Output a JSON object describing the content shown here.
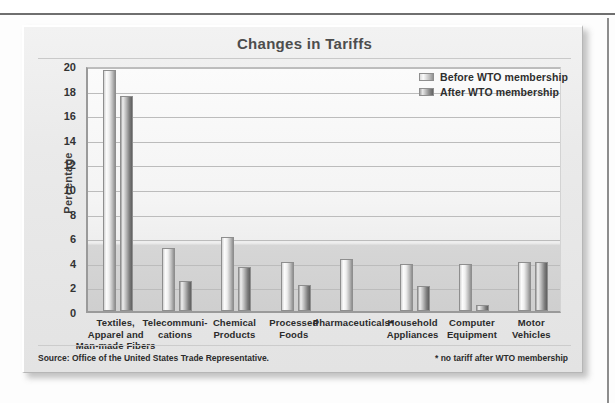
{
  "chart_data": {
    "type": "bar",
    "title": "Changes in Tariffs",
    "xlabel": "",
    "ylabel": "Percentage",
    "ylim": [
      0,
      20
    ],
    "ytick_step": 2,
    "yticks": [
      20,
      18,
      16,
      14,
      12,
      10,
      8,
      6,
      4,
      2,
      0
    ],
    "grid": true,
    "legend_position": "top-right",
    "categories": [
      "Textiles, Apparel and Man-made Fibers",
      "Telecommuni- cations",
      "Chemical Products",
      "Processed Foods",
      "Pharmaceuticals*",
      "Household Appliances",
      "Computer Equipment",
      "Motor Vehicles"
    ],
    "category_lines": [
      [
        "Textiles,",
        "Apparel and",
        "Man-made Fibers"
      ],
      [
        "Telecommuni-",
        "cations"
      ],
      [
        "Chemical",
        "Products"
      ],
      [
        "Processed",
        "Foods"
      ],
      [
        "Pharmaceuticals*"
      ],
      [
        "Household",
        "Appliances"
      ],
      [
        "Computer",
        "Equipment"
      ],
      [
        "Motor",
        "Vehicles"
      ]
    ],
    "series": [
      {
        "name": "Before WTO membership",
        "values": [
          19.6,
          5.1,
          6.0,
          4.0,
          4.2,
          3.8,
          3.8,
          4.0
        ]
      },
      {
        "name": "After WTO membership",
        "values": [
          17.5,
          2.4,
          3.6,
          2.15,
          0,
          2.0,
          0.5,
          4.0
        ]
      }
    ],
    "annotations": [
      "* no tariff after WTO membership"
    ]
  },
  "legend": {
    "items": [
      {
        "label": "Before WTO membership",
        "swatch": "before-swatch"
      },
      {
        "label": "After WTO membership",
        "swatch": "after-swatch"
      }
    ]
  },
  "footer": {
    "source": "Source: Office of the United States Trade Representative.",
    "footnote": "* no tariff after WTO membership"
  },
  "colors": {
    "title": "#4d4d4d",
    "axis": "#9a9a9a",
    "grid": "#bcbcbc",
    "before_bar": "#e8e8e8",
    "after_bar": "#8c8c8c",
    "panel_bg": "#ededed"
  }
}
